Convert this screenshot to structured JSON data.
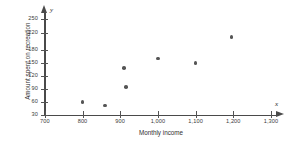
{
  "chart_data": {
    "type": "scatter",
    "title": "",
    "xlabel": "Monthly income",
    "ylabel": "Amount spent on recreation",
    "x_axis_symbol": "x",
    "y_axis_symbol": "y",
    "xlim": [
      700,
      1300
    ],
    "ylim": [
      30,
      250
    ],
    "grid": false,
    "legend": null,
    "xticks": [
      700,
      800,
      900,
      1000,
      1100,
      1200,
      1300
    ],
    "xtick_labels": [
      "700",
      "800",
      "900",
      "1,000",
      "1,100",
      "1,200",
      "1,300"
    ],
    "yticks": [
      30,
      60,
      90,
      120,
      150,
      180,
      220,
      250
    ],
    "ytick_labels": [
      "30",
      "60",
      "90",
      "120",
      "150",
      "180",
      "220",
      "250"
    ],
    "marker_color": "#555555",
    "axis_color": "#4a4a4a",
    "points": [
      {
        "x": 800,
        "y": 60
      },
      {
        "x": 860,
        "y": 52
      },
      {
        "x": 910,
        "y": 138
      },
      {
        "x": 915,
        "y": 95
      },
      {
        "x": 1000,
        "y": 160
      },
      {
        "x": 1100,
        "y": 150
      },
      {
        "x": 1195,
        "y": 210
      }
    ]
  }
}
